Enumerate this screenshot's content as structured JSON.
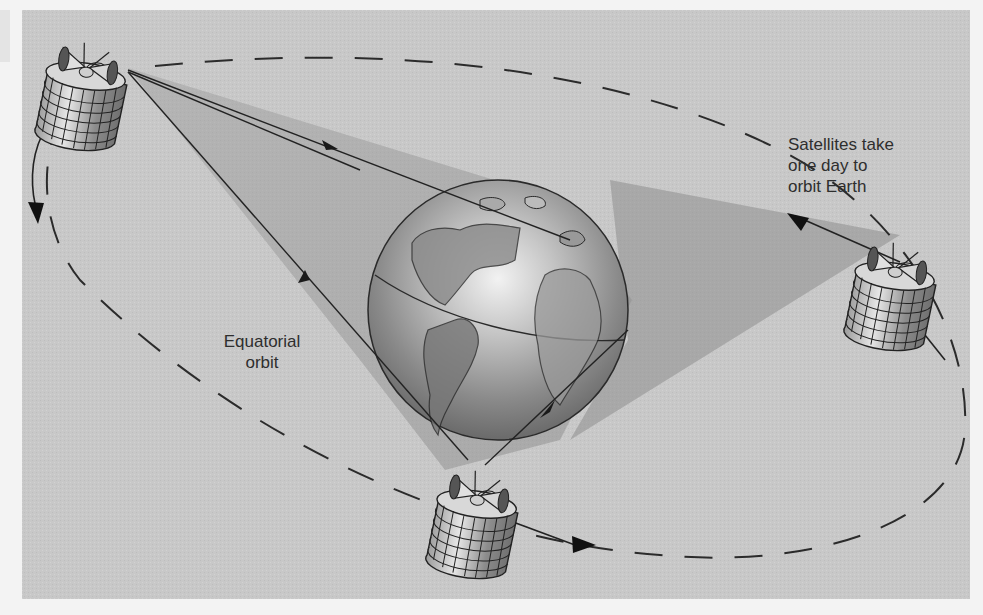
{
  "diagram": {
    "type": "geostationary satellite orbit illustration",
    "background_color": "#c9c9c9",
    "labels": {
      "orbit_period": [
        "Satellites take",
        "one day to",
        "orbit Earth"
      ],
      "orbit_type": [
        "Equatorial",
        "orbit"
      ]
    },
    "nodes": [
      {
        "id": "earth",
        "kind": "globe",
        "label": ""
      },
      {
        "id": "satellite-top-left",
        "kind": "satellite"
      },
      {
        "id": "satellite-right",
        "kind": "satellite"
      },
      {
        "id": "satellite-bottom",
        "kind": "satellite"
      }
    ],
    "edges": [
      {
        "from": "satellite-top-left",
        "to": "earth",
        "style": "signal-line-arrow"
      },
      {
        "from": "earth",
        "to": "satellite-top-left",
        "style": "signal-line-arrow"
      },
      {
        "from": "satellite-bottom",
        "to": "earth",
        "style": "signal-line-arrow"
      },
      {
        "from": "satellite-right",
        "to": "orbit",
        "style": "motion-arrow"
      },
      {
        "from": "satellite-top-left",
        "to": "orbit",
        "style": "motion-arrow"
      },
      {
        "from": "satellite-bottom",
        "to": "orbit",
        "style": "motion-arrow"
      }
    ],
    "orbit_path": {
      "style": "dashed-ellipse"
    }
  }
}
